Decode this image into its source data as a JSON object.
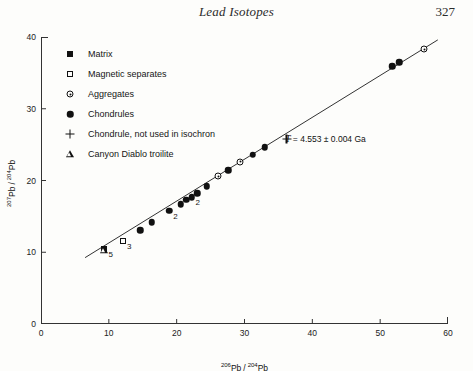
{
  "header": {
    "title": "Lead Isotopes",
    "page_number": "327"
  },
  "chart_data": {
    "type": "scatter",
    "title": "",
    "xlabel": "206Pb / 204Pb",
    "ylabel": "207Pb / 204Pb",
    "xlabel_parts": {
      "mass": "206",
      "nuclide": "Pb",
      "sep": "/",
      "mass2": "204",
      "nuclide2": "Pb"
    },
    "ylabel_parts": {
      "mass": "207",
      "nuclide": "Pb",
      "sep": "/",
      "mass2": "204",
      "nuclide2": "Pb"
    },
    "xlim": [
      0,
      60
    ],
    "ylim": [
      0,
      40
    ],
    "xticks": [
      0,
      10,
      20,
      30,
      40,
      50,
      60
    ],
    "yticks": [
      0,
      10,
      20,
      30,
      40
    ],
    "grid": false,
    "legend_position": "upper-left-inside",
    "annotation": {
      "symbol": "T",
      "text": " = 4.553 ± 0.004 Ga",
      "full_text": "T = 4.553 ± 0.004 Ga",
      "x": 36.0,
      "y": 25.6
    },
    "isochron_line": {
      "x_start": 6.5,
      "y_start": 9.25,
      "x_end": 58.5,
      "y_end": 39.6,
      "slope": 0.5837,
      "intercept": 5.46
    },
    "series": [
      {
        "name": "Matrix",
        "marker": "filled-square",
        "points": [
          {
            "x": 9.35,
            "y": 10.45,
            "label": "5"
          }
        ]
      },
      {
        "name": "Magnetic separates",
        "marker": "open-square",
        "points": [
          {
            "x": 12.1,
            "y": 11.5,
            "label": "3"
          }
        ]
      },
      {
        "name": "Aggregates",
        "marker": "circle-dot",
        "points": [
          {
            "x": 26.1,
            "y": 20.6,
            "label": ""
          },
          {
            "x": 29.4,
            "y": 22.6,
            "label": ""
          },
          {
            "x": 56.5,
            "y": 38.3,
            "label": ""
          }
        ]
      },
      {
        "name": "Chondrules",
        "marker": "filled-circle",
        "points": [
          {
            "x": 14.6,
            "y": 13.1,
            "label": ""
          },
          {
            "x": 16.3,
            "y": 14.2,
            "label": ""
          },
          {
            "x": 18.9,
            "y": 15.8,
            "label": "2"
          },
          {
            "x": 20.6,
            "y": 16.7,
            "label": ""
          },
          {
            "x": 21.4,
            "y": 17.3,
            "label": ""
          },
          {
            "x": 22.2,
            "y": 17.7,
            "label": "2"
          },
          {
            "x": 23.0,
            "y": 18.2,
            "label": ""
          },
          {
            "x": 24.4,
            "y": 19.2,
            "label": ""
          },
          {
            "x": 27.6,
            "y": 21.4,
            "label": ""
          },
          {
            "x": 31.2,
            "y": 23.6,
            "label": ""
          },
          {
            "x": 33.0,
            "y": 24.6,
            "label": ""
          },
          {
            "x": 51.8,
            "y": 35.9,
            "label": ""
          },
          {
            "x": 52.8,
            "y": 36.5,
            "label": ""
          }
        ]
      },
      {
        "name": "Chondrule, not used in isochron",
        "marker": "plus",
        "points": [
          {
            "x": 36.2,
            "y": 25.8,
            "label": ""
          }
        ]
      },
      {
        "name": "Canyon Diablo troilite",
        "marker": "triangle",
        "points": [
          {
            "x": 9.3,
            "y": 10.3,
            "label": ""
          }
        ]
      }
    ],
    "legend": [
      {
        "label": "Matrix",
        "marker": "filled-square"
      },
      {
        "label": "Magnetic separates",
        "marker": "open-square"
      },
      {
        "label": "Aggregates",
        "marker": "circle-dot"
      },
      {
        "label": "Chondrules",
        "marker": "filled-circle"
      },
      {
        "label": "Chondrule, not used in isochron",
        "marker": "plus"
      },
      {
        "label": "Canyon Diablo troilite",
        "marker": "triangle"
      }
    ],
    "colors": {
      "ink": "#111111",
      "page": "#fdfdfb",
      "axis": "#333333"
    }
  }
}
